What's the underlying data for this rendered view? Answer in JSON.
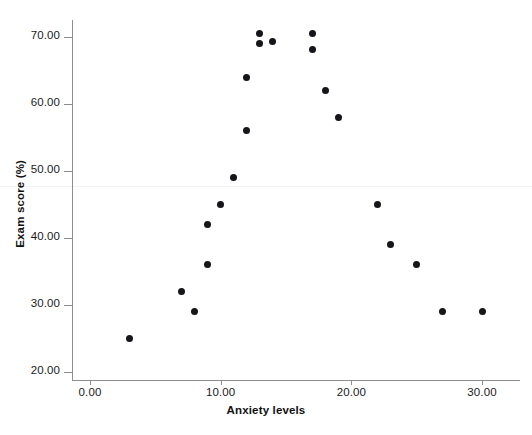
{
  "chart_data": {
    "type": "scatter",
    "title": "",
    "xlabel": "Anxiety levels",
    "ylabel": "Exam score (%)",
    "xlim": [
      0,
      30
    ],
    "ylim": [
      20,
      70
    ],
    "xticks": [
      "0.00",
      "10.00",
      "20.00",
      "30.00"
    ],
    "xtick_values": [
      0,
      10,
      20,
      30
    ],
    "yticks": [
      "20.00",
      "30.00",
      "40.00",
      "50.00",
      "60.00",
      "70.00"
    ],
    "ytick_values": [
      20,
      30,
      40,
      50,
      60,
      70
    ],
    "grid": false,
    "legend": false,
    "marker_color": "#15151a",
    "axis_color": "#8d8d8d",
    "background": "#ffffff",
    "x": [
      3,
      7,
      8,
      9,
      9,
      10,
      11,
      12,
      12,
      13,
      13,
      14,
      17,
      17,
      18,
      19,
      22,
      23,
      25,
      27,
      30
    ],
    "y": [
      25,
      32,
      29,
      36,
      42,
      45,
      49,
      56,
      64,
      69,
      70.5,
      69.3,
      68.2,
      70.5,
      62,
      58,
      45,
      39,
      36,
      29,
      29
    ],
    "points": [
      {
        "x": 3,
        "y": 25
      },
      {
        "x": 7,
        "y": 32
      },
      {
        "x": 8,
        "y": 29
      },
      {
        "x": 9,
        "y": 36
      },
      {
        "x": 9,
        "y": 42
      },
      {
        "x": 10,
        "y": 45
      },
      {
        "x": 11,
        "y": 49
      },
      {
        "x": 12,
        "y": 56
      },
      {
        "x": 12,
        "y": 64
      },
      {
        "x": 13,
        "y": 69
      },
      {
        "x": 13,
        "y": 70.5
      },
      {
        "x": 14,
        "y": 69.3
      },
      {
        "x": 17,
        "y": 68.2
      },
      {
        "x": 17,
        "y": 70.5
      },
      {
        "x": 18,
        "y": 62
      },
      {
        "x": 19,
        "y": 58
      },
      {
        "x": 22,
        "y": 45
      },
      {
        "x": 23,
        "y": 39
      },
      {
        "x": 25,
        "y": 36
      },
      {
        "x": 27,
        "y": 29
      },
      {
        "x": 30,
        "y": 29
      }
    ]
  }
}
